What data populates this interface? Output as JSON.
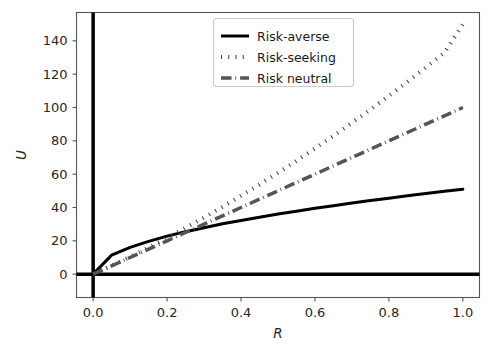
{
  "figure": {
    "background_color": "#ffffff",
    "axes_facecolor": "#ffffff",
    "spine_color": "#555555"
  },
  "chart_data": {
    "type": "line",
    "title": "",
    "xlabel": "R",
    "ylabel": "U",
    "xlim": [
      -0.045,
      1.045
    ],
    "ylim": [
      -14,
      157
    ],
    "xticks": [
      0.0,
      0.2,
      0.4,
      0.6,
      0.8,
      1.0
    ],
    "xticklabels": [
      "0.0",
      "0.2",
      "0.4",
      "0.6",
      "0.8",
      "1.0"
    ],
    "yticks": [
      0,
      20,
      40,
      60,
      80,
      100,
      120,
      140
    ],
    "yticklabels": [
      "0",
      "20",
      "40",
      "60",
      "80",
      "100",
      "120",
      "140"
    ],
    "grid": false,
    "legend_position": "upper center",
    "axis_lines": {
      "vertical_at_x": 0.0,
      "horizontal_at_y": 0,
      "color": "#000000",
      "linewidth": 3.5
    },
    "x": [
      0.0,
      0.05,
      0.1,
      0.15,
      0.2,
      0.25,
      0.3,
      0.35,
      0.4,
      0.45,
      0.5,
      0.55,
      0.6,
      0.65,
      0.7,
      0.75,
      0.8,
      0.85,
      0.9,
      0.95,
      1.0
    ],
    "series": [
      {
        "name": "Risk-averse",
        "style": "solid",
        "color": "#000000",
        "linewidth": 3.0,
        "values": [
          0.0,
          11.4,
          16.1,
          19.7,
          22.8,
          25.5,
          27.9,
          30.2,
          32.2,
          34.2,
          36.1,
          37.8,
          39.5,
          41.1,
          42.7,
          44.2,
          45.6,
          47.0,
          48.4,
          49.7,
          51.0
        ]
      },
      {
        "name": "Risk-seeking",
        "style": "dotted",
        "color": "#444444",
        "linewidth": 4.0,
        "values": [
          0.0,
          5.1,
          10.4,
          16.0,
          21.8,
          27.8,
          34.0,
          40.4,
          47.0,
          53.8,
          60.8,
          68.0,
          75.4,
          83.0,
          90.8,
          98.8,
          107.0,
          115.4,
          124.0,
          132.8,
          150.0
        ]
      },
      {
        "name": "Risk neutral",
        "style": "dashdot",
        "color": "#555555",
        "linewidth": 3.5,
        "values": [
          0.0,
          5.0,
          10.0,
          15.0,
          20.0,
          25.0,
          30.0,
          35.0,
          40.0,
          45.0,
          50.0,
          55.0,
          60.0,
          65.0,
          70.0,
          75.0,
          80.0,
          85.0,
          90.0,
          95.0,
          100.0
        ]
      }
    ]
  },
  "legend": {
    "items": [
      {
        "label": "Risk-averse",
        "style": "solid",
        "color": "#000000"
      },
      {
        "label": "Risk-seeking",
        "style": "dotted",
        "color": "#444444"
      },
      {
        "label": "Risk neutral",
        "style": "dashdot",
        "color": "#555555"
      }
    ],
    "frame_color": "#cccccc",
    "background_color": "#ffffff"
  }
}
